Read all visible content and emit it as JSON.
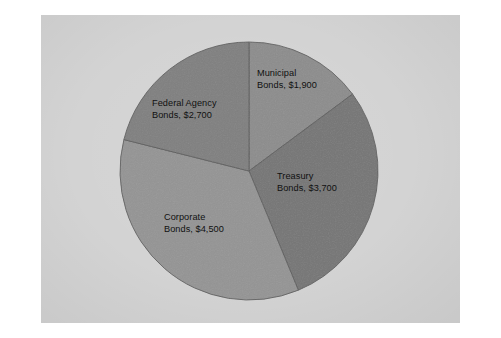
{
  "figure": {
    "background_color": "#ffffff",
    "plate_color": "#d8d8d8",
    "label_text_color": "#111111",
    "slice_edge_color": "#5c5c5c"
  },
  "chart_data": {
    "type": "pie",
    "title": "",
    "subtitle": "",
    "xlabel": "",
    "ylabel": "",
    "legend_position": "none",
    "grid": false,
    "value_prefix": "$",
    "total": 12800,
    "categories": [
      "Municipal Bonds",
      "Treasury Bonds",
      "Corporate Bonds",
      "Federal Agency Bonds"
    ],
    "values": [
      1900,
      3700,
      4500,
      2700
    ],
    "start_angle_deg": 0,
    "direction": "clockwise",
    "slices": [
      {
        "name": "Municipal Bonds",
        "value": 1900,
        "value_text": "$1,900",
        "percent": 14.8,
        "start_angle_deg": 0.0,
        "end_angle_deg": 53.4,
        "color": "#8c8c8c",
        "label_line1": "Municipal",
        "label_line2": "Bonds, $1,900"
      },
      {
        "name": "Treasury Bonds",
        "value": 3700,
        "value_text": "$3,700",
        "percent": 28.9,
        "start_angle_deg": 53.4,
        "end_angle_deg": 157.5,
        "color": "#757575",
        "label_line1": "Treasury",
        "label_line2": "Bonds, $3,700"
      },
      {
        "name": "Corporate Bonds",
        "value": 4500,
        "value_text": "$4,500",
        "percent": 35.2,
        "start_angle_deg": 157.5,
        "end_angle_deg": 284.1,
        "color": "#949494",
        "label_line1": "Corporate",
        "label_line2": "Bonds, $4,500"
      },
      {
        "name": "Federal Agency Bonds",
        "value": 2700,
        "value_text": "$2,700",
        "percent": 21.1,
        "start_angle_deg": 284.1,
        "end_angle_deg": 360.0,
        "color": "#7f7f7f",
        "label_line1": "Federal Agency",
        "label_line2": "Bonds, $2,700"
      }
    ],
    "geometry": {
      "center_x": 249,
      "center_y": 171,
      "radius": 129
    }
  }
}
